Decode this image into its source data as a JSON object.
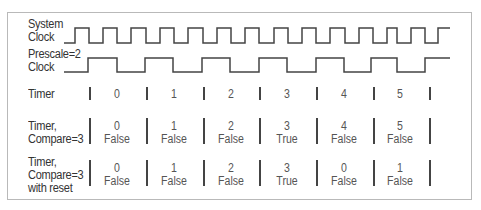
{
  "diagram": {
    "colors": {
      "line": "#444444",
      "border": "#b9b9b9",
      "text": "#333333"
    },
    "rows": [
      {
        "id": "system-clock",
        "label_lines": [
          "System",
          "Clock"
        ]
      },
      {
        "id": "prescale-clock",
        "label_lines": [
          "Prescale=2",
          "Clock"
        ]
      },
      {
        "id": "timer",
        "label_lines": [
          "Timer"
        ],
        "values": [
          "0",
          "1",
          "2",
          "3",
          "4",
          "5"
        ]
      },
      {
        "id": "timer-compare",
        "label_lines": [
          "Timer,",
          "Compare=3"
        ],
        "values": [
          "0",
          "1",
          "2",
          "3",
          "4",
          "5"
        ],
        "flags": [
          "False",
          "False",
          "False",
          "True",
          "False",
          "False"
        ]
      },
      {
        "id": "timer-compare-reset",
        "label_lines": [
          "Timer,",
          "Compare=3",
          "with reset"
        ],
        "values": [
          "0",
          "1",
          "2",
          "3",
          "0",
          "1"
        ],
        "flags": [
          "False",
          "False",
          "False",
          "True",
          "False",
          "False"
        ]
      }
    ]
  }
}
